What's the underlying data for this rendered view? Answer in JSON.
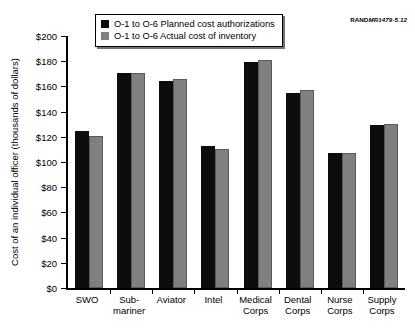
{
  "figure": {
    "source_id_mark": "RAND",
    "source_id_number": "MR1479-5.12"
  },
  "legend": {
    "position": "top-center-inside",
    "entries": [
      {
        "label": "O-1 to O-6 Planned cost authorizations",
        "color": "#0d0d0d",
        "swatch_name": "planned-swatch"
      },
      {
        "label": "O-1 to O-6 Actual cost of inventory",
        "color": "#808080",
        "swatch_name": "actual-swatch"
      }
    ]
  },
  "chart_data": {
    "type": "bar",
    "title": "",
    "subtitle": "",
    "xlabel": "",
    "ylabel": "Cost of an individual officer\n(thousands of dollars)",
    "ylim": [
      0,
      200
    ],
    "ytick_step": 20,
    "ytick_labels": [
      "$0",
      "$20",
      "$40",
      "$60",
      "$80",
      "$100",
      "$120",
      "$140",
      "$160",
      "$180",
      "$200"
    ],
    "ytick_values": [
      0,
      20,
      40,
      60,
      80,
      100,
      120,
      140,
      160,
      180,
      200
    ],
    "grid": false,
    "categories": [
      "SWO",
      "Sub-\nmariner",
      "Aviator",
      "Intel",
      "Medical\nCorps",
      "Dental\nCorps",
      "Nurse\nCorps",
      "Supply\nCorps"
    ],
    "series": [
      {
        "name": "O-1 to O-6 Planned cost authorizations",
        "color": "#0d0d0d",
        "values": [
          125,
          171,
          164,
          113,
          179,
          155,
          107,
          129
        ]
      },
      {
        "name": "O-1 to O-6 Actual cost of inventory",
        "color": "#808080",
        "values": [
          121,
          171,
          166,
          110,
          181,
          157,
          107,
          130
        ]
      }
    ],
    "units": "thousands of dollars"
  }
}
